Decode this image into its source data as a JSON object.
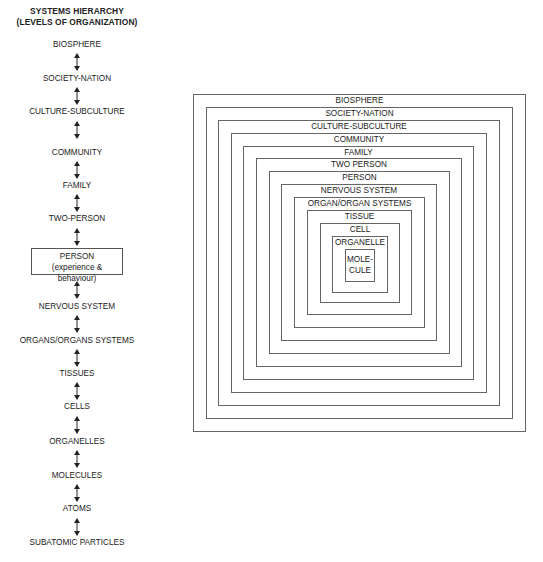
{
  "hierarchy": {
    "title_line1": "SYSTEMS HIERARCHY",
    "title_line2": "(LEVELS OF ORGANIZATION)",
    "levels": [
      {
        "label": "BIOSPHERE"
      },
      {
        "label": "SOCIETY-NATION"
      },
      {
        "label": "CULTURE-SUBCULTURE"
      },
      {
        "label": "COMMUNITY"
      },
      {
        "label": "FAMILY"
      },
      {
        "label": "TWO-PERSON"
      },
      {
        "label": "PERSON",
        "sublabel": "(experience & behaviour)",
        "boxed": true
      },
      {
        "label": "NERVOUS SYSTEM"
      },
      {
        "label": "ORGANS/ORGANS SYSTEMS"
      },
      {
        "label": "TISSUES"
      },
      {
        "label": "CELLS"
      },
      {
        "label": "ORGANELLES"
      },
      {
        "label": "MOLECULES"
      },
      {
        "label": "ATOMS"
      },
      {
        "label": "SUBATOMIC PARTICLES"
      }
    ],
    "connector_icon": "double-headed-vertical-arrow"
  },
  "nested": {
    "boxes": [
      {
        "label": "BIOSPHERE"
      },
      {
        "label": "SOCIETY-NATION"
      },
      {
        "label": "CULTURE-SUBCULTURE"
      },
      {
        "label": "COMMUNITY"
      },
      {
        "label": "FAMILY"
      },
      {
        "label": "TWO PERSON"
      },
      {
        "label": "PERSON"
      },
      {
        "label": "NERVOUS SYSTEM"
      },
      {
        "label": "ORGAN/ORGAN SYSTEMS"
      },
      {
        "label": "TISSUE"
      },
      {
        "label": "CELL"
      },
      {
        "label": "ORGANELLE"
      },
      {
        "label": "MOLE-",
        "label2": "CULE"
      }
    ]
  },
  "colors": {
    "line": "#666666",
    "text": "#222222",
    "background": "#ffffff"
  }
}
